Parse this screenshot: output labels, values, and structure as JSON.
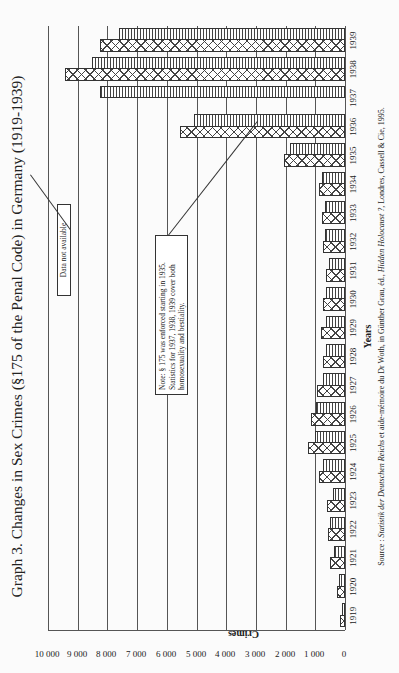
{
  "title": "Graph 3. Changes in Sex Crimes (§175 of the Penal Code) in Germany (1919-1939)",
  "chart_data": {
    "type": "bar",
    "orientation": "vertical (figure rotated 90° on page)",
    "title": "Graph 3. Changes in Sex Crimes (§175 of the Penal Code) in Germany (1919-1939)",
    "xlabel": "Years",
    "ylabel": "Crimes",
    "ylim": [
      0,
      10000
    ],
    "yticks": [
      "0",
      "1 000",
      "2 000",
      "3 000",
      "4 000",
      "5 000",
      "6 000",
      "7 000",
      "8 000",
      "9 000",
      "10 000"
    ],
    "grid": true,
    "legend": null,
    "categories": [
      "1919",
      "1920",
      "1921",
      "1922",
      "1923",
      "1924",
      "1925",
      "1926",
      "1927",
      "1928",
      "1929",
      "1930",
      "1931",
      "1932",
      "1933",
      "1934",
      "1935",
      "1936",
      "1937",
      "1938",
      "1939"
    ],
    "series": [
      {
        "name": "Series 1 (cross-hatched)",
        "pattern": "crosshatch",
        "values": [
          170,
          270,
          510,
          580,
          610,
          880,
          1250,
          1150,
          940,
          740,
          810,
          740,
          640,
          740,
          780,
          880,
          2060,
          5540,
          null,
          9430,
          8240
        ]
      },
      {
        "name": "Series 2 (vertical-striped)",
        "pattern": "vertical-lines",
        "values": [
          100,
          200,
          370,
          510,
          400,
          740,
          1010,
          980,
          740,
          640,
          640,
          640,
          540,
          680,
          680,
          780,
          1860,
          5070,
          8240,
          8510,
          7600
        ]
      }
    ],
    "annotations": [
      {
        "text": "Note: § 175 was enforced starting in 1935. Statistics for 1937, 1938, 1939 cover both homosexuality and bestiality.",
        "points_to": "1934"
      },
      {
        "text": "Data not available",
        "points_to": "1937 (cross-hatched series)"
      }
    ],
    "source": "Source : Statistik der Deutschen Reichs et aide-mémoire du Dr Woth, in Günther Grau, éd., Hidden Holocaust ?, Londres, Cassell & Cie, 1995."
  },
  "axis": {
    "ylabel": "Crimes",
    "xlabel": "Years",
    "yticks": [
      "0",
      "1 000",
      "2 000",
      "3 000",
      "4 000",
      "5 000",
      "6 000",
      "7 000",
      "8 000",
      "9 000",
      "10 000"
    ]
  },
  "notes": {
    "enforcement": "Note: § 175 was enforced starting in 1935. Statistics for 1937, 1938, 1939 cover both homosexuality and bestiality.",
    "missing": "Data not available"
  },
  "source": {
    "prefix": "Source : ",
    "italic1": "Statistik der Deutschen Reichs",
    "mid": " et aide-mémoire du Dr Woth, in Günther Grau, éd., ",
    "italic2": "Hidden Holocaust ?",
    "suffix": ", Londres, Cassell & Cie, 1995."
  }
}
